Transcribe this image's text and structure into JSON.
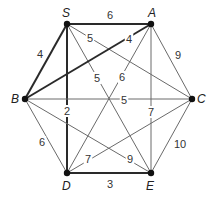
{
  "graph": {
    "vertices": [
      {
        "id": "S",
        "label": "S",
        "x": 67,
        "y": 24,
        "lx": 62,
        "ly": 17
      },
      {
        "id": "A",
        "label": "A",
        "x": 151,
        "y": 24,
        "lx": 148,
        "ly": 17
      },
      {
        "id": "B",
        "label": "B",
        "x": 25,
        "y": 99,
        "lx": 11,
        "ly": 103
      },
      {
        "id": "C",
        "label": "C",
        "x": 192,
        "y": 99,
        "lx": 197,
        "ly": 103
      },
      {
        "id": "D",
        "label": "D",
        "x": 67,
        "y": 173,
        "lx": 62,
        "ly": 190
      },
      {
        "id": "E",
        "label": "E",
        "x": 151,
        "y": 173,
        "lx": 146,
        "ly": 190
      }
    ],
    "edges": [
      {
        "from": "S",
        "to": "A",
        "weight": "6",
        "bold": true,
        "lx": 110,
        "ly": 19
      },
      {
        "from": "S",
        "to": "B",
        "weight": "4",
        "bold": true,
        "lx": 40,
        "ly": 58
      },
      {
        "from": "S",
        "to": "D",
        "weight": "2",
        "bold": true,
        "lx": 67,
        "ly": 115
      },
      {
        "from": "S",
        "to": "C",
        "weight": "5",
        "bold": false,
        "lx": 90,
        "ly": 42
      },
      {
        "from": "S",
        "to": "E",
        "weight": "5",
        "bold": false,
        "lx": 97,
        "ly": 82
      },
      {
        "from": "A",
        "to": "B",
        "weight": "4",
        "bold": true,
        "lx": 129,
        "ly": 43
      },
      {
        "from": "A",
        "to": "D",
        "weight": "6",
        "bold": false,
        "lx": 122,
        "ly": 81
      },
      {
        "from": "A",
        "to": "E",
        "weight": "7",
        "bold": false,
        "lx": 151,
        "ly": 116
      },
      {
        "from": "A",
        "to": "C",
        "weight": "9",
        "bold": false,
        "lx": 178,
        "ly": 59
      },
      {
        "from": "B",
        "to": "C",
        "weight": "5",
        "bold": false,
        "lx": 124,
        "ly": 104
      },
      {
        "from": "B",
        "to": "D",
        "weight": "6",
        "bold": false,
        "lx": 42,
        "ly": 146
      },
      {
        "from": "B",
        "to": "E",
        "weight": "9",
        "bold": false,
        "lx": 130,
        "ly": 163
      },
      {
        "from": "C",
        "to": "D",
        "weight": "7",
        "bold": false,
        "lx": 88,
        "ly": 163
      },
      {
        "from": "C",
        "to": "E",
        "weight": "10",
        "bold": false,
        "lx": 180,
        "ly": 148
      },
      {
        "from": "D",
        "to": "E",
        "weight": "3",
        "bold": true,
        "lx": 110,
        "ly": 188
      }
    ]
  }
}
